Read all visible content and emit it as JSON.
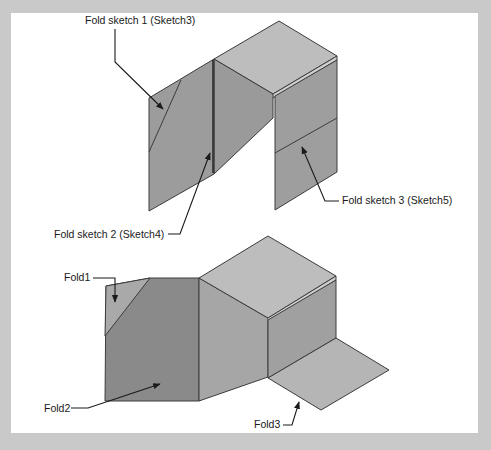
{
  "figure": {
    "background_color": "#c9c9c9",
    "panel_color": "#ffffff",
    "face_colors": {
      "top_light": "#bdbdbd",
      "side_mid": "#9e9e9e",
      "side_dark": "#8a8a8a",
      "flap_light": "#b3b3b3",
      "fold_triangle": "#a8a8a8",
      "edge": "#3c3c3c"
    },
    "top_diagram": {
      "name": "before-fold",
      "callouts": [
        {
          "id": "fold-sketch-1",
          "label": "Fold sketch 1 (Sketch3)"
        },
        {
          "id": "fold-sketch-2",
          "label": "Fold sketch 2 (Sketch4)"
        },
        {
          "id": "fold-sketch-3",
          "label": "Fold sketch 3 (Sketch5)"
        }
      ]
    },
    "bottom_diagram": {
      "name": "after-fold",
      "callouts": [
        {
          "id": "fold1",
          "label": "Fold1"
        },
        {
          "id": "fold2",
          "label": "Fold2"
        },
        {
          "id": "fold3",
          "label": "Fold3"
        }
      ]
    }
  }
}
